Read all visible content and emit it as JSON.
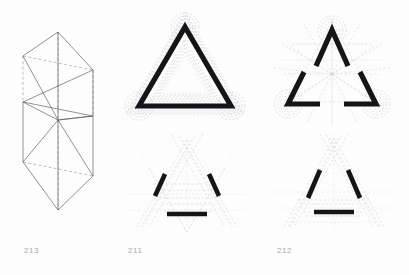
{
  "page": {
    "background": "#fdfdfd",
    "width": 409,
    "height": 275
  },
  "colors": {
    "ink": "#151518",
    "line": "#4a4a52",
    "dashed": "#8d8d96",
    "construction": "#c9c9d2",
    "construction_faint": "#dcdce3",
    "caption": "#a9a9ad"
  },
  "figures": [
    {
      "id": "fig-213",
      "caption": "213",
      "kind": "isometric-folded-polyhedron",
      "description": "Axonometric wireframe of a folded prismatic solid with solid visible edges and dashed hidden edges"
    },
    {
      "id": "fig-211",
      "caption": "211",
      "kind": "triangle-offset-study",
      "panels": [
        {
          "id": "fig-211-top",
          "description": "Thick outlined equilateral triangle with concentric dashed offset contours and rounded corner spirals"
        },
        {
          "id": "fig-211-bottom",
          "description": "Three thick chord segments arranged hexagonally with dashed triangular construction grid"
        }
      ]
    },
    {
      "id": "fig-212",
      "caption": "212",
      "kind": "triangle-corner-study",
      "panels": [
        {
          "id": "fig-212-top",
          "description": "Three thick V-shaped corner elements with radiating dashed construction rays and corner spirals"
        },
        {
          "id": "fig-212-bottom",
          "description": "Two thick inclined strokes and one thick horizontal stroke over a dashed triangular grid"
        }
      ]
    }
  ],
  "captions": {
    "left": "213",
    "center": "211",
    "right": "212"
  }
}
